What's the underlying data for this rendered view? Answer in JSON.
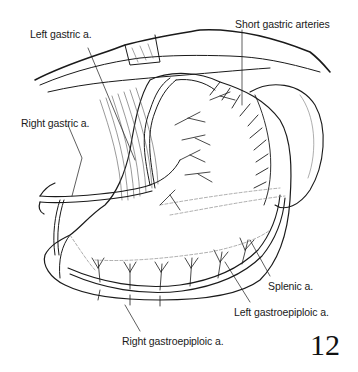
{
  "figure": {
    "number": "12",
    "labels": [
      {
        "id": "left-gastric",
        "text": "Left gastric a.",
        "x": 30,
        "y": 28
      },
      {
        "id": "short-gastric",
        "text": "Short gastric arteries",
        "x": 235,
        "y": 18
      },
      {
        "id": "right-gastric",
        "text": "Right gastric a.",
        "x": 21,
        "y": 117
      },
      {
        "id": "splenic",
        "text": "Splenic a.",
        "x": 268,
        "y": 280
      },
      {
        "id": "left-gastroepiploic",
        "text": "Left gastroepiploic a.",
        "x": 234,
        "y": 306
      },
      {
        "id": "right-gastroepiploic",
        "text": "Right gastroepiploic a.",
        "x": 122,
        "y": 335
      }
    ],
    "colors": {
      "ink": "#1a1a1a",
      "background": "#ffffff",
      "hatch": "#555555"
    }
  }
}
